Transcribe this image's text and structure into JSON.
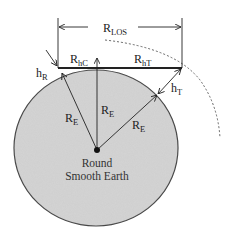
{
  "diagram": {
    "labels": {
      "r_los": {
        "main": "R",
        "sub": "LOS"
      },
      "r_hc": {
        "main": "R",
        "sub": "hC"
      },
      "r_ht": {
        "main": "R",
        "sub": "hT"
      },
      "h_r": {
        "main": "h",
        "sub": "R"
      },
      "h_t": {
        "main": "h",
        "sub": "T"
      },
      "r_e_left": {
        "main": "R",
        "sub": "E"
      },
      "r_e_center": {
        "main": "R",
        "sub": "E"
      },
      "r_e_right": {
        "main": "R",
        "sub": "E"
      }
    },
    "earth_caption": {
      "line1": "Round",
      "line2": "Smooth Earth"
    },
    "colors": {
      "earth_fill": "#d4d4d4",
      "earth_stroke": "#444444",
      "line": "#222222",
      "background": "#ffffff"
    }
  }
}
